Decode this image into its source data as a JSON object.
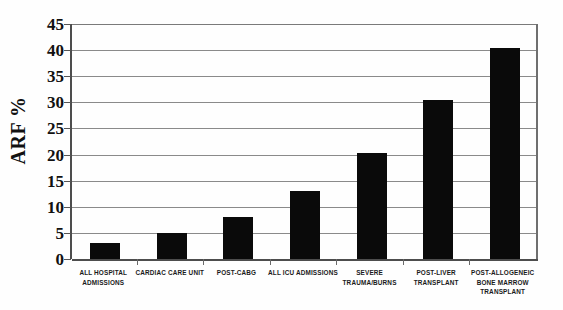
{
  "chart_data": {
    "type": "bar",
    "title": "",
    "subtitle": "",
    "xlabel": "",
    "ylabel": "ARF %",
    "ylim": [
      0,
      45
    ],
    "ytick_step": 5,
    "yticks": [
      45,
      40,
      35,
      30,
      25,
      20,
      15,
      10,
      5,
      0
    ],
    "ytick_labels": [
      "45",
      "40",
      "35",
      "30",
      "25",
      "20",
      "15",
      "10",
      "5",
      "0"
    ],
    "grid": true,
    "grid_axis": "y",
    "legend": false,
    "legend_position": "none",
    "orientation": "vertical",
    "categories": [
      "ALL HOSPITAL ADMISSIONS",
      "CARDIAC CARE UNIT",
      "POST-CABG",
      "ALL ICU ADMISSIONS",
      "SEVERE TRAUMA/BURNS",
      "POST-LIVER TRANSPLANT",
      "POST-ALLOGENEIC BONE MARROW TRANSPLANT"
    ],
    "category_label_lines": [
      [
        "ALL HOSPITAL",
        "ADMISSIONS"
      ],
      [
        "CARDIAC CARE UNIT"
      ],
      [
        "POST-CABG"
      ],
      [
        "ALL ICU ADMISSIONS"
      ],
      [
        "SEVERE",
        "TRAUMA/BURNS"
      ],
      [
        "POST-LIVER",
        "TRANSPLANT"
      ],
      [
        "POST-ALLOGENEIC",
        "BONE MARROW",
        "TRANSPLANT"
      ]
    ],
    "values": [
      3,
      5,
      8,
      13,
      20.3,
      30.4,
      40.5
    ],
    "value_unit": "%",
    "series": [
      {
        "name": "ARF %",
        "color": "#0a0a0a",
        "values": [
          3,
          5,
          8,
          13,
          20.3,
          30.4,
          40.5
        ]
      }
    ]
  },
  "colors": {
    "bar": "#0a0a0a",
    "gridline": "#8a8a8a",
    "axis": "#4d4d4d",
    "background": "#ffffff",
    "text": "#111111"
  }
}
